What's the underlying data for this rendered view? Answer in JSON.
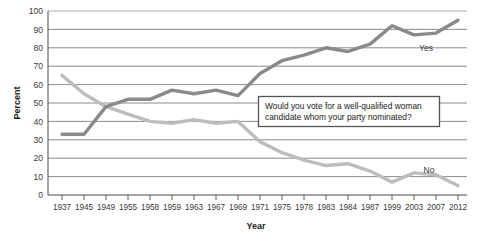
{
  "chart_data": {
    "type": "line",
    "title": "",
    "xlabel": "Year",
    "ylabel": "Percent",
    "ylim": [
      0,
      100
    ],
    "ytick_step": 10,
    "yticks": [
      0,
      10,
      20,
      30,
      40,
      50,
      60,
      70,
      80,
      90,
      100
    ],
    "grid": true,
    "grid_axis": "y",
    "legend_position": "inline-right",
    "categories": [
      "1937",
      "1945",
      "1949",
      "1955",
      "1958",
      "1959",
      "1963",
      "1967",
      "1969",
      "1971",
      "1975",
      "1978",
      "1983",
      "1984",
      "1987",
      "1999",
      "2003",
      "2007",
      "2012"
    ],
    "series": [
      {
        "name": "Yes",
        "color": "#8a8a8a",
        "values": [
          33,
          33,
          48,
          52,
          52,
          57,
          55,
          57,
          54,
          66,
          73,
          76,
          80,
          78,
          82,
          92,
          87,
          88,
          95
        ]
      },
      {
        "name": "No",
        "color": "#bdbdbd",
        "values": [
          65,
          55,
          48,
          44,
          40,
          39,
          41,
          39,
          40,
          29,
          23,
          19,
          16,
          17,
          13,
          7,
          12,
          11,
          5
        ]
      }
    ],
    "annotations": [
      {
        "name": "survey-question",
        "line1": "Would you vote for a well-qualified woman",
        "line2": "candidate whom your party nominated?"
      }
    ]
  },
  "labels": {
    "y_0": "0",
    "y_10": "10",
    "y_20": "20",
    "y_30": "30",
    "y_40": "40",
    "y_50": "50",
    "y_60": "60",
    "y_70": "70",
    "y_80": "80",
    "y_90": "90",
    "y_100": "100",
    "x_1": "1937",
    "x_2": "1945",
    "x_3": "1949",
    "x_4": "1955",
    "x_5": "1958",
    "x_6": "1959",
    "x_7": "1963",
    "x_8": "1967",
    "x_9": "1969",
    "x_10": "1971",
    "x_11": "1975",
    "x_12": "1978",
    "x_13": "1983",
    "x_14": "1984",
    "x_15": "1987",
    "x_16": "1999",
    "x_17": "2003",
    "x_18": "2007",
    "x_19": "2012",
    "axis_x_title": "Year",
    "axis_y_title": "Percent",
    "series_yes": "Yes",
    "series_no": "No",
    "annot_line1": "Would you vote for a well-qualified woman",
    "annot_line2": "candidate whom your party nominated?"
  }
}
